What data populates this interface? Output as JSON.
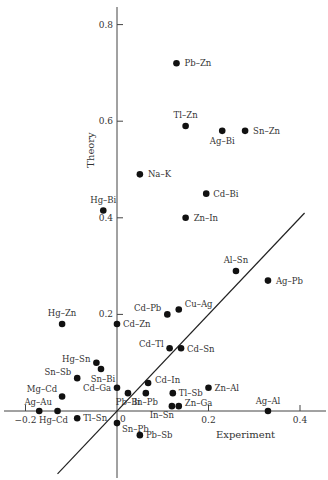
{
  "chart_data": {
    "type": "scatter",
    "title": "",
    "xlabel": "Experiment",
    "ylabel": "Theory",
    "xlim": [
      -0.2,
      0.45
    ],
    "ylim": [
      -0.14,
      0.84
    ],
    "grid": false,
    "legend": null,
    "x_ticks": [
      {
        "value": -0.2,
        "label": "−0.2"
      },
      {
        "value": 0.2,
        "label": "0.2"
      },
      {
        "value": 0.4,
        "label": "0.4"
      }
    ],
    "y_ticks": [
      {
        "value": 0.2,
        "label": "0.2"
      },
      {
        "value": 0.4,
        "label": "0.4"
      },
      {
        "value": 0.6,
        "label": "0.6"
      },
      {
        "value": 0.8,
        "label": "0.8"
      }
    ],
    "origin_label": "0",
    "reference_line": {
      "description": "line of agreement",
      "from": [
        -0.13,
        -0.13
      ],
      "to": [
        0.41,
        0.41
      ]
    },
    "points": [
      {
        "label": "Pb–Zn",
        "x": 0.13,
        "y": 0.72,
        "lx": 8,
        "ly": 3,
        "anchor": "start"
      },
      {
        "label": "Tl–Zn",
        "x": 0.15,
        "y": 0.59,
        "lx": 0,
        "ly": -8,
        "anchor": "middle"
      },
      {
        "label": "Ag–Bi",
        "x": 0.23,
        "y": 0.58,
        "lx": 0,
        "ly": 13,
        "anchor": "middle"
      },
      {
        "label": "Sn–Zn",
        "x": 0.28,
        "y": 0.58,
        "lx": 8,
        "ly": 3,
        "anchor": "start"
      },
      {
        "label": "Na–K",
        "x": 0.05,
        "y": 0.49,
        "lx": 8,
        "ly": 3,
        "anchor": "start"
      },
      {
        "label": "Cd–Bi",
        "x": 0.195,
        "y": 0.45,
        "lx": 7,
        "ly": 3,
        "anchor": "start"
      },
      {
        "label": "Zn–In",
        "x": 0.15,
        "y": 0.4,
        "lx": 8,
        "ly": 3,
        "anchor": "start"
      },
      {
        "label": "Hg–Bi",
        "x": -0.03,
        "y": 0.415,
        "lx": 0,
        "ly": -8,
        "anchor": "middle"
      },
      {
        "label": "Al–Sn",
        "x": 0.26,
        "y": 0.29,
        "lx": 0,
        "ly": -8,
        "anchor": "middle"
      },
      {
        "label": "Ag–Pb",
        "x": 0.33,
        "y": 0.27,
        "lx": 8,
        "ly": 3,
        "anchor": "start"
      },
      {
        "label": "Cd–Pb",
        "x": 0.11,
        "y": 0.2,
        "lx": -6,
        "ly": -3,
        "anchor": "end"
      },
      {
        "label": "Cu–Ag",
        "x": 0.135,
        "y": 0.21,
        "lx": 6,
        "ly": -3,
        "anchor": "start"
      },
      {
        "label": "Cd–Zn",
        "x": 0.0,
        "y": 0.18,
        "lx": 6,
        "ly": 3,
        "anchor": "start"
      },
      {
        "label": "Hg–Zn",
        "x": -0.12,
        "y": 0.18,
        "lx": 0,
        "ly": -8,
        "anchor": "middle"
      },
      {
        "label": "Cd–Tl",
        "x": 0.115,
        "y": 0.13,
        "lx": -6,
        "ly": -1,
        "anchor": "end"
      },
      {
        "label": "Cd–Sn",
        "x": 0.14,
        "y": 0.13,
        "lx": 6,
        "ly": 4,
        "anchor": "start"
      },
      {
        "label": "Hg–Sn",
        "x": -0.045,
        "y": 0.1,
        "lx": -6,
        "ly": -1,
        "anchor": "end"
      },
      {
        "label": "Sn–Bi",
        "x": -0.035,
        "y": 0.087,
        "lx": 2,
        "ly": 13,
        "anchor": "middle"
      },
      {
        "label": "Sn–Sb",
        "x": -0.087,
        "y": 0.068,
        "lx": -6,
        "ly": -3,
        "anchor": "end"
      },
      {
        "label": "Mg–Cd",
        "x": -0.12,
        "y": 0.03,
        "lx": -5,
        "ly": -5,
        "anchor": "end"
      },
      {
        "label": "Ag–Au",
        "x": -0.17,
        "y": 0.0,
        "lx": -1,
        "ly": -6,
        "anchor": "middle"
      },
      {
        "label": "Hg–Cd",
        "x": -0.13,
        "y": 0.0,
        "lx": -4,
        "ly": 12,
        "anchor": "middle"
      },
      {
        "label": "Tl–Sn",
        "x": -0.087,
        "y": -0.015,
        "lx": 6,
        "ly": 3,
        "anchor": "start"
      },
      {
        "label": "Cd–Ga",
        "x": 0.0,
        "y": 0.048,
        "lx": -6,
        "ly": 3,
        "anchor": "end"
      },
      {
        "label": "Pb–Bi",
        "x": 0.024,
        "y": 0.037,
        "lx": 0,
        "ly": 12,
        "anchor": "middle"
      },
      {
        "label": "Cd–In",
        "x": 0.068,
        "y": 0.058,
        "lx": 7,
        "ly": 0,
        "anchor": "start"
      },
      {
        "label": "In–Pb",
        "x": 0.063,
        "y": 0.037,
        "lx": 0,
        "ly": 12,
        "anchor": "middle"
      },
      {
        "label": "Tl–Sb",
        "x": 0.122,
        "y": 0.037,
        "lx": 6,
        "ly": 3,
        "anchor": "start"
      },
      {
        "label": "In–Sn",
        "x": 0.12,
        "y": 0.01,
        "lx": -10,
        "ly": 12,
        "anchor": "middle"
      },
      {
        "label": "Zn–Ga",
        "x": 0.135,
        "y": 0.01,
        "lx": 6,
        "ly": 0,
        "anchor": "start"
      },
      {
        "label": "Zn–Al",
        "x": 0.2,
        "y": 0.048,
        "lx": 6,
        "ly": 3,
        "anchor": "start"
      },
      {
        "label": "Ag–Al",
        "x": 0.33,
        "y": 0.0,
        "lx": 0,
        "ly": -7,
        "anchor": "middle"
      },
      {
        "label": "Sn–Pb",
        "x": 0.0,
        "y": -0.025,
        "lx": 5,
        "ly": 9,
        "anchor": "start"
      },
      {
        "label": "Pb–Sb",
        "x": 0.05,
        "y": -0.05,
        "lx": 6,
        "ly": 3,
        "anchor": "start"
      }
    ]
  }
}
